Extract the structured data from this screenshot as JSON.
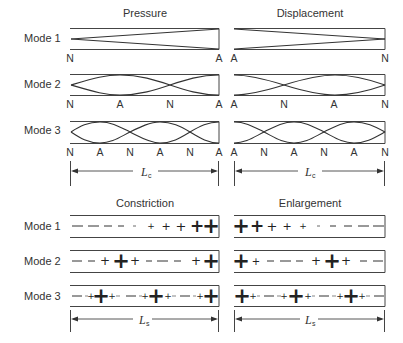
{
  "top_section": {
    "column_titles": [
      "Pressure",
      "Displacement"
    ],
    "modes": [
      {
        "label": "Mode 1",
        "pressure_nodes": [
          "N",
          "A"
        ],
        "displacement_nodes": [
          "A",
          "N"
        ]
      },
      {
        "label": "Mode 2",
        "pressure_nodes": [
          "N",
          "A",
          "N",
          "A"
        ],
        "displacement_nodes": [
          "A",
          "N",
          "A",
          "N"
        ]
      },
      {
        "label": "Mode 3",
        "pressure_nodes": [
          "N",
          "A",
          "N",
          "A",
          "N",
          "A"
        ],
        "displacement_nodes": [
          "A",
          "N",
          "A",
          "N",
          "A",
          "N"
        ]
      }
    ],
    "dimension": {
      "symbol": "L",
      "subscript": "c"
    }
  },
  "bottom_section": {
    "column_titles": [
      "Constriction",
      "Enlargement"
    ],
    "modes": [
      {
        "label": "Mode 1",
        "constriction": [
          "—",
          "—",
          "-",
          "-",
          "-",
          "+",
          "+",
          "+",
          "+",
          "+"
        ],
        "enlargement": [
          "+",
          "+",
          "+",
          "+",
          "+",
          "-",
          "-",
          "-",
          "—",
          "—"
        ]
      },
      {
        "label": "Mode 2",
        "constriction": [
          "—",
          "-",
          "+",
          "+",
          "+",
          "-",
          "—",
          "-",
          "+",
          "+"
        ],
        "enlargement": [
          "+",
          "+",
          "-",
          "—",
          "-",
          "+",
          "+",
          "+",
          "-",
          "-"
        ]
      },
      {
        "label": "Mode 3",
        "constriction": [
          "—",
          "+",
          "+",
          "+",
          "—",
          "+",
          "+",
          "+",
          "—",
          "+",
          "+"
        ],
        "enlargement": [
          "+",
          "+",
          "—",
          "+",
          "+",
          "+",
          "—",
          "+",
          "+",
          "+",
          "-"
        ]
      }
    ],
    "dimension": {
      "symbol": "L",
      "subscript": "s"
    }
  },
  "colors": {
    "line": "#333333",
    "text": "#333333",
    "background": "#ffffff"
  }
}
